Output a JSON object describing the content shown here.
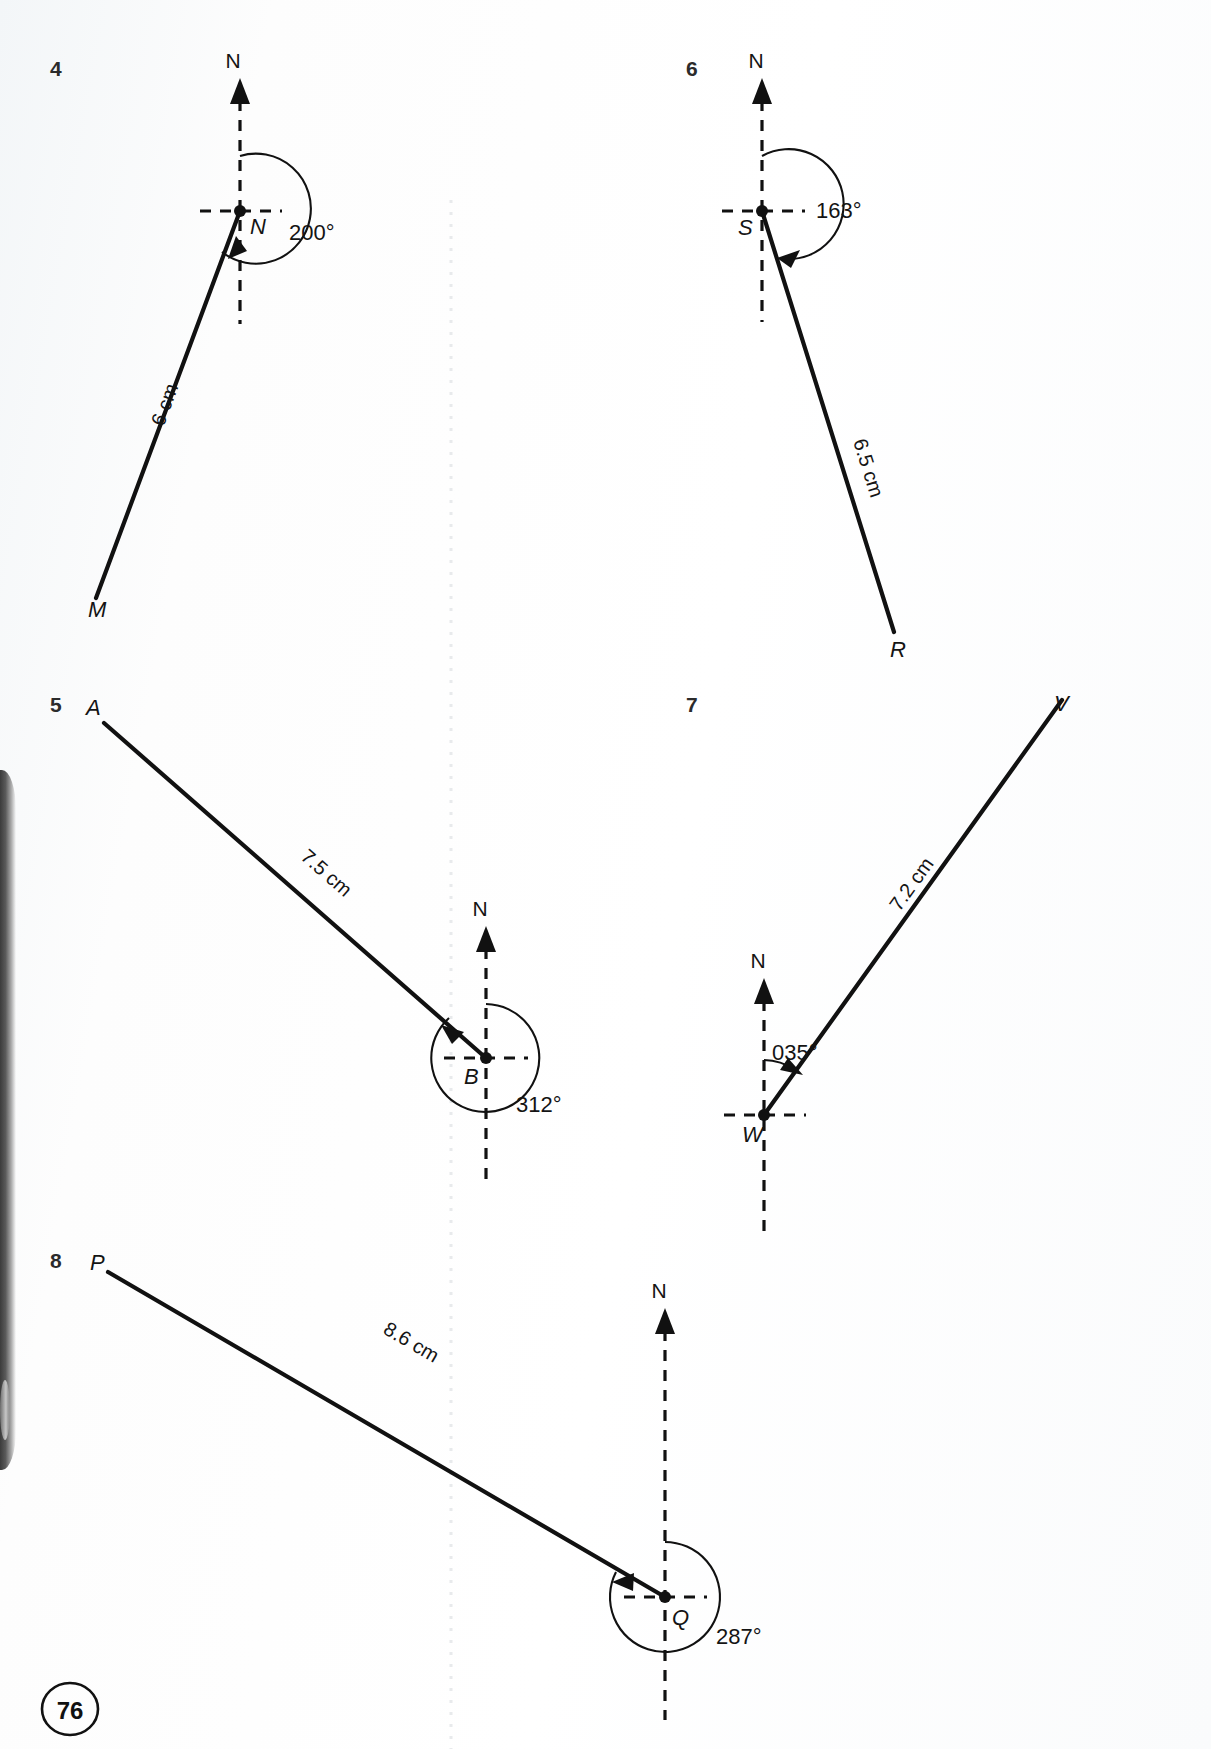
{
  "page": {
    "number": "76"
  },
  "problems": [
    {
      "number": "4",
      "north_label": "N",
      "vertex_label": "N",
      "endpoint_label": "M",
      "bearing": "200°",
      "length": "6 cm"
    },
    {
      "number": "5",
      "north_label": "N",
      "vertex_label": "B",
      "endpoint_label": "A",
      "bearing": "312°",
      "length": "7.5 cm"
    },
    {
      "number": "6",
      "north_label": "N",
      "vertex_label": "S",
      "endpoint_label": "R",
      "bearing": "163°",
      "length": "6.5 cm"
    },
    {
      "number": "7",
      "north_label": "N",
      "vertex_label": "W",
      "endpoint_label": "V",
      "bearing": "035°",
      "length": "7.2 cm"
    },
    {
      "number": "8",
      "north_label": "N",
      "vertex_label": "Q",
      "endpoint_label": "P",
      "bearing": "287°",
      "length": "8.6 cm"
    }
  ],
  "colors": {
    "ink": "#111111",
    "paper": "#ffffff",
    "muted": "#2b2b2b"
  }
}
